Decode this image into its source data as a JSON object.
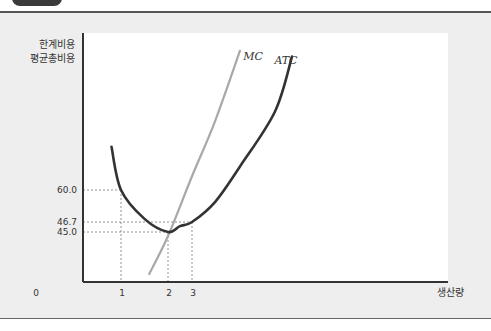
{
  "chart_data": {
    "type": "line",
    "title": "",
    "ylabel_lines": [
      "한계비용",
      "평균총비용"
    ],
    "xlabel": "생산량",
    "origin_label": "0",
    "x_ticks": [
      "1",
      "2",
      "3"
    ],
    "y_ticks": [
      "60.0",
      "46.7",
      "45.0"
    ],
    "xlim": [
      0,
      9
    ],
    "ylim": [
      20,
      140
    ],
    "grid": false,
    "series": [
      {
        "name": "MC",
        "color": "#a8a8a8",
        "points": [
          [
            1.6,
            24
          ],
          [
            2,
            43
          ],
          [
            3,
            67
          ],
          [
            4,
            95
          ],
          [
            5,
            131
          ]
        ]
      },
      {
        "name": "ATC",
        "color": "#333333",
        "points": [
          [
            0.75,
            82
          ],
          [
            1,
            60
          ],
          [
            1.5,
            48
          ],
          [
            2,
            45
          ],
          [
            2.5,
            46
          ],
          [
            3,
            46.7
          ],
          [
            4,
            55
          ],
          [
            5,
            72
          ],
          [
            6,
            100
          ],
          [
            6.5,
            128
          ]
        ]
      }
    ],
    "reference_lines": [
      {
        "x": 1,
        "y": 60.0
      },
      {
        "x": 2,
        "y": 45.0
      },
      {
        "x": 3,
        "y": 46.7
      }
    ]
  }
}
